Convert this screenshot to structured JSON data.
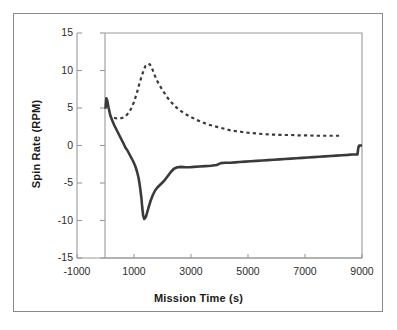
{
  "figure": {
    "background_color": "#ffffff",
    "border_color": "#8a8a8a",
    "axis_color": "#9a9a9a",
    "series_color": "#3a3a3a"
  },
  "chart_data": {
    "type": "line",
    "title": "",
    "xlabel": "Mission Time (s)",
    "ylabel": "Spin Rate (RPM)",
    "xlim": [
      -1000,
      9000
    ],
    "ylim": [
      -15,
      15
    ],
    "xticks": [
      -1000,
      1000,
      3000,
      5000,
      7000,
      9000
    ],
    "yticks": [
      15,
      10,
      5,
      0,
      -5,
      -10,
      -15
    ],
    "xtick_labels": [
      "-1000",
      "1000",
      "3000",
      "5000",
      "7000",
      "9000"
    ],
    "ytick_labels": [
      "15",
      "10",
      "5",
      "0",
      "-5",
      "-10",
      "-15"
    ],
    "grid": false,
    "legend": null,
    "series": [
      {
        "name": "solid-spin-rate",
        "style": "solid",
        "color": "#3a3a3a",
        "linewidth": 2.6,
        "x": [
          0,
          30,
          60,
          110,
          170,
          240,
          320,
          400,
          480,
          560,
          640,
          700,
          760,
          830,
          900,
          970,
          1040,
          1100,
          1160,
          1210,
          1260,
          1290,
          1320,
          1360,
          1420,
          1500,
          1580,
          1660,
          1740,
          1820,
          1900,
          1980,
          2060,
          2140,
          2220,
          2300,
          2400,
          2520,
          2650,
          2800,
          2950,
          3100,
          3300,
          3500,
          3700,
          3900,
          4050,
          4200,
          4380,
          4550,
          4700,
          4900,
          5100,
          5300,
          5500,
          5700,
          5900,
          6100,
          6300,
          6500,
          6700,
          6900,
          7100,
          7300,
          7500,
          7700,
          7900,
          8100,
          8300,
          8500,
          8650,
          8780,
          8840,
          8870,
          8900,
          8960,
          9000
        ],
        "y": [
          4.9,
          6.3,
          6.0,
          5.0,
          4.0,
          3.3,
          2.6,
          2.0,
          1.4,
          0.8,
          0.2,
          -0.3,
          -0.6,
          -1.1,
          -1.6,
          -2.1,
          -2.7,
          -3.4,
          -4.3,
          -5.5,
          -7.0,
          -8.3,
          -9.3,
          -9.8,
          -9.5,
          -8.4,
          -7.4,
          -6.6,
          -6.0,
          -5.6,
          -5.3,
          -5.0,
          -4.7,
          -4.3,
          -3.9,
          -3.5,
          -3.1,
          -2.9,
          -2.85,
          -2.9,
          -2.9,
          -2.85,
          -2.8,
          -2.75,
          -2.7,
          -2.6,
          -2.35,
          -2.3,
          -2.3,
          -2.25,
          -2.2,
          -2.15,
          -2.1,
          -2.05,
          -2.0,
          -1.95,
          -1.9,
          -1.85,
          -1.8,
          -1.75,
          -1.7,
          -1.65,
          -1.6,
          -1.55,
          -1.5,
          -1.45,
          -1.4,
          -1.35,
          -1.3,
          -1.25,
          -1.2,
          -1.2,
          -1.2,
          -0.3,
          0.0,
          0.0,
          0.0
        ]
      },
      {
        "name": "dashed-spin-rate",
        "style": "dashed",
        "color": "#3a3a3a",
        "linewidth": 2.2,
        "x": [
          300,
          400,
          500,
          600,
          700,
          800,
          900,
          1000,
          1100,
          1200,
          1300,
          1400,
          1500,
          1560,
          1620,
          1700,
          1800,
          1900,
          2000,
          2150,
          2300,
          2450,
          2600,
          2800,
          3000,
          3200,
          3400,
          3600,
          3800,
          4000,
          4200,
          4400,
          4600,
          4800,
          5000,
          5300,
          5600,
          5900,
          6200,
          6500,
          6800,
          7100,
          7400,
          7700,
          8000,
          8200
        ],
        "y": [
          3.7,
          3.6,
          3.6,
          3.7,
          3.9,
          4.3,
          4.9,
          5.8,
          7.0,
          8.4,
          9.6,
          10.6,
          10.9,
          10.8,
          10.4,
          9.6,
          8.7,
          8.0,
          7.4,
          6.5,
          5.8,
          5.2,
          4.7,
          4.2,
          3.8,
          3.4,
          3.1,
          2.8,
          2.6,
          2.4,
          2.2,
          2.0,
          1.9,
          1.8,
          1.7,
          1.6,
          1.5,
          1.45,
          1.4,
          1.4,
          1.35,
          1.35,
          1.3,
          1.3,
          1.3,
          1.3
        ]
      }
    ]
  }
}
